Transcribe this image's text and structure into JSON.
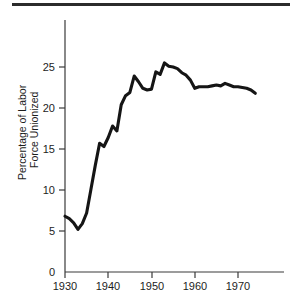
{
  "figure": {
    "rule_label": "top-divider"
  },
  "chart_data": {
    "type": "line",
    "title": "",
    "xlabel": "",
    "ylabel": "Percentage of Labor Force Unionized",
    "ylabel_line1": "Percentage of Labor",
    "ylabel_line2": "Force Unionized",
    "xlim": [
      1929,
      1975
    ],
    "ylim": [
      0,
      27
    ],
    "grid": false,
    "legend": "none",
    "xticks": [
      1930,
      1940,
      1950,
      1960,
      1970
    ],
    "xticklabels": [
      "1930",
      "1940",
      "1950",
      "1960",
      "1970"
    ],
    "yticks": [
      0,
      5,
      10,
      15,
      20,
      25
    ],
    "yticklabels": [
      "0",
      "5",
      "10",
      "15",
      "20",
      "25"
    ],
    "line_color": "#151515",
    "series": [
      {
        "name": "Percentage of Labor Force Unionized",
        "x": [
          1930,
          1931,
          1932,
          1933,
          1934,
          1935,
          1936,
          1937,
          1938,
          1939,
          1940,
          1941,
          1942,
          1943,
          1944,
          1945,
          1946,
          1947,
          1948,
          1949,
          1950,
          1951,
          1952,
          1953,
          1954,
          1955,
          1956,
          1957,
          1958,
          1959,
          1960,
          1961,
          1962,
          1963,
          1964,
          1965,
          1966,
          1967,
          1968,
          1969,
          1970,
          1971,
          1972,
          1973,
          1974
        ],
        "y": [
          6.8,
          6.5,
          6.0,
          5.2,
          5.9,
          7.2,
          10.1,
          13.0,
          15.7,
          15.3,
          16.4,
          17.8,
          17.2,
          20.4,
          21.5,
          21.9,
          23.9,
          23.2,
          22.4,
          22.2,
          22.3,
          24.4,
          24.1,
          25.5,
          25.1,
          25.0,
          24.8,
          24.3,
          24.0,
          23.4,
          22.4,
          22.6,
          22.6,
          22.6,
          22.7,
          22.8,
          22.7,
          23.0,
          22.8,
          22.6,
          22.6,
          22.5,
          22.4,
          22.2,
          21.8
        ]
      }
    ]
  }
}
